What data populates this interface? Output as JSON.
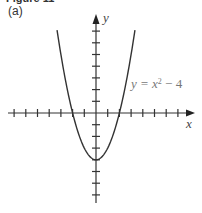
{
  "figure": {
    "title": "Figure 11",
    "part_label": "(a)"
  },
  "axes": {
    "x_label": "x",
    "y_label": "y",
    "x_ticks_count_left": 7,
    "x_ticks_count_right": 7,
    "y_ticks_count_up": 7,
    "y_ticks_count_down": 7
  },
  "curve": {
    "equation_prefix": "y = x",
    "equation_exponent": "2",
    "equation_suffix": " − 4",
    "color": "#333333"
  },
  "chart_data": {
    "type": "line",
    "xlabel": "x",
    "ylabel": "y",
    "xlim": [
      -7.5,
      8.2
    ],
    "ylim": [
      -7.5,
      8.3
    ],
    "grid": false,
    "series": [
      {
        "name": "y = x^2 - 4",
        "x": [
          -3.3,
          -3,
          -2.5,
          -2,
          -1.5,
          -1,
          -0.5,
          0,
          0.5,
          1,
          1.5,
          2,
          2.5,
          3,
          3.3
        ],
        "y": [
          6.89,
          5,
          2.25,
          0,
          -1.75,
          -3,
          -3.75,
          -4,
          -3.75,
          -3,
          -1.75,
          0,
          2.25,
          5,
          6.89
        ]
      }
    ],
    "annotations": [
      {
        "text": "y = x² − 4",
        "x": 3,
        "y": 2.2
      }
    ]
  }
}
